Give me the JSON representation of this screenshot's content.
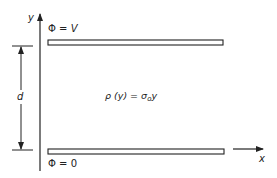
{
  "diagram": {
    "axes": {
      "y_label": "y",
      "x_label": "x"
    },
    "top_plate": {
      "label_symbol": "Φ",
      "label_eq": " = ",
      "label_value": "V"
    },
    "bottom_plate": {
      "label_symbol": "Φ",
      "label_eq": " = ",
      "label_value": "0"
    },
    "separation": {
      "label": "d"
    },
    "charge_density": {
      "lhs_symbol": "ρ",
      "lhs_arg": " (y)",
      "eq": " = ",
      "rhs_symbol": "σ",
      "rhs_sub": "o",
      "rhs_var": "y"
    },
    "colors": {
      "stroke": "#222222",
      "background": "#ffffff"
    }
  }
}
